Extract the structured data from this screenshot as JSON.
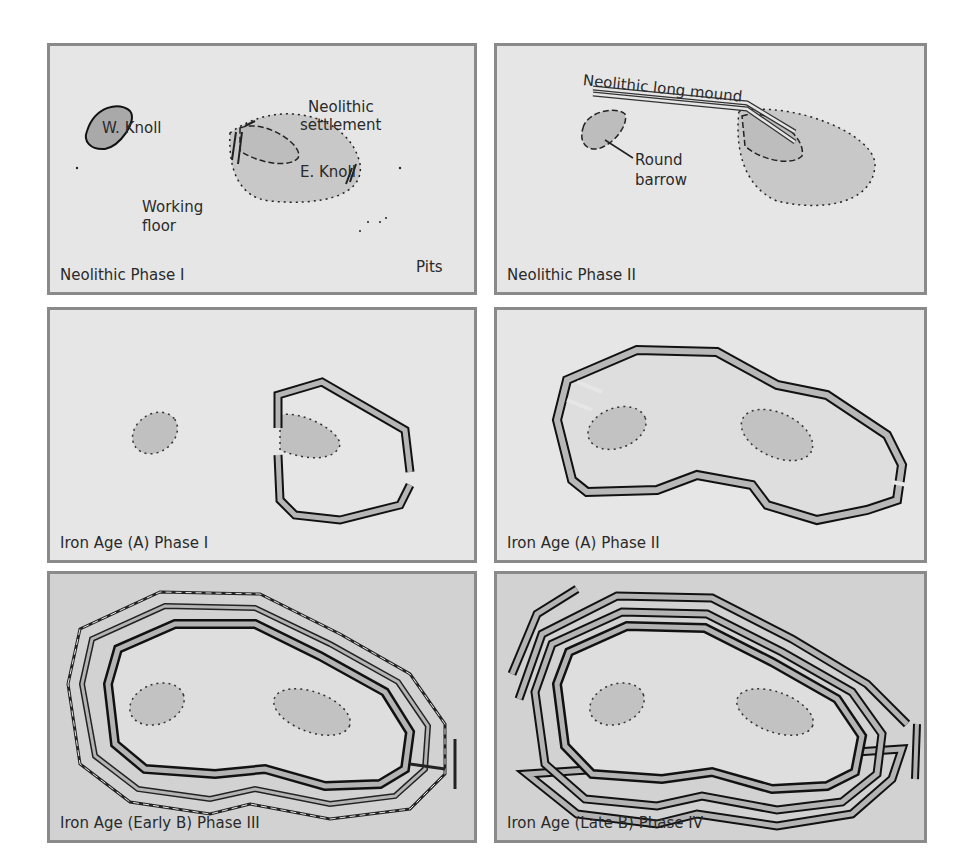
{
  "figure": {
    "colors": {
      "panel_bg": "#e6e6e6",
      "panel_bg_dark": "#d2d2d2",
      "panel_border": "#8a8a8a",
      "fill_gray": "#b4b4b4",
      "ink": "#1a1a1a"
    },
    "panels": [
      {
        "caption": "Neolithic Phase I",
        "labels": {
          "w_knoll": "W. Knoll",
          "settlement": "Neolithic\nsettlement",
          "settlement_l1": "Neolithic",
          "settlement_l2": "settlement",
          "e_knoll": "E. Knoll",
          "working_l1": "Working",
          "working_l2": "floor",
          "pits": "Pits"
        }
      },
      {
        "caption": "Neolithic Phase II",
        "labels": {
          "long_mound": "Neolithic long mound",
          "round_l1": "Round",
          "round_l2": "barrow"
        }
      },
      {
        "caption": "Iron Age (A) Phase I"
      },
      {
        "caption": "Iron Age (A) Phase II"
      },
      {
        "caption": "Iron Age (Early B) Phase III"
      },
      {
        "caption": "Iron Age (Late B) Phase IV"
      }
    ]
  }
}
